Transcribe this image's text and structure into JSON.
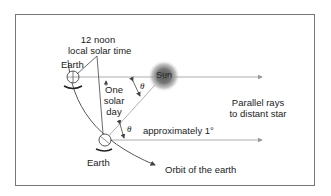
{
  "diagram": {
    "labels": {
      "noon_line1": "12 noon",
      "noon_line2": "local solar time",
      "earth_top": "Earth",
      "earth_bottom": "Earth",
      "sun": "Sun",
      "solar_day_line1": "One",
      "solar_day_line2": "solar",
      "solar_day_line3": "day",
      "theta_upper": "θ",
      "theta_lower": "θ",
      "approx": "approximately 1°",
      "parallel_line1": "Parallel rays",
      "parallel_line2": "to distant star",
      "orbit": "Orbit of the earth"
    },
    "colors": {
      "line": "#555555",
      "ray": "#9a9a9a",
      "frame": "#777777",
      "sun": "#6a6a6a"
    }
  }
}
